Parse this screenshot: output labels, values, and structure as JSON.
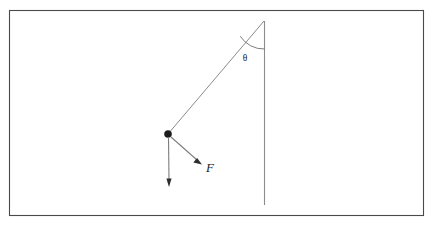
{
  "figure": {
    "kind": "physics-force-diagram",
    "background_color": "#ffffff",
    "frame": {
      "stroke_color": "#4a4a4a",
      "x": 9,
      "y": 10,
      "width": 415,
      "height": 206
    }
  },
  "labels": {
    "angle": "θ",
    "force": "F"
  },
  "geometry": {
    "pivot": {
      "x": 264,
      "y": 21
    },
    "bob": {
      "x": 168,
      "y": 134
    },
    "reference_line": {
      "x1": 264,
      "y1": 21,
      "x2": 265,
      "y2": 205
    },
    "string": {
      "x1": 264,
      "y1": 21,
      "x2": 168,
      "y2": 134
    },
    "weight_vector": {
      "x1": 168,
      "y1": 136,
      "x2": 169,
      "y2": 186
    },
    "force_vector": {
      "x1": 171,
      "y1": 137,
      "x2": 201,
      "y2": 163
    },
    "angle_arc": {
      "cx": 264,
      "cy": 21,
      "radius": 28
    },
    "angle_label_pos": {
      "x": 245,
      "y": 61
    },
    "force_label_pos": {
      "x": 206,
      "y": 172
    },
    "bob_radius": 3.6
  },
  "colors": {
    "frame_stroke": "#4a4a4a",
    "line_stroke": "#8a8a8a",
    "reference_stroke": "#8c8c8c",
    "arc_stroke": "#6e6e6e",
    "arrow_fill": "#2e2e2e",
    "bob_fill": "#1a1a1a",
    "text_fill": "#1c1c1c"
  }
}
